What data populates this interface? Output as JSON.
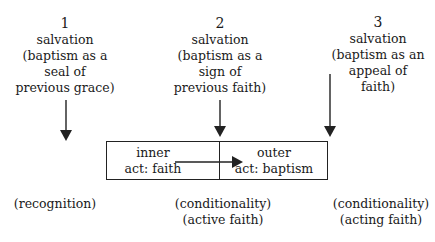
{
  "columns": [
    {
      "number": "1",
      "lines": [
        "salvation",
        "(baptism as a",
        "seal of",
        "previous grace)"
      ]
    },
    {
      "number": "2",
      "lines": [
        "salvation",
        "(baptism as a",
        "sign of",
        "previous faith)"
      ]
    },
    {
      "number": "3",
      "lines": [
        "salvation",
        "(baptism as an",
        "appeal of",
        "faith)"
      ]
    }
  ],
  "box": {
    "inner": {
      "line1": "inner",
      "line2": "act: faith"
    },
    "outer": {
      "line1": "outer",
      "line2": "act: baptism"
    }
  },
  "bottom_labels": [
    {
      "lines": [
        "(recognition)"
      ]
    },
    {
      "lines": [
        "(conditionality)",
        "(active faith)"
      ]
    },
    {
      "lines": [
        "(conditionality)",
        "(acting faith)"
      ]
    }
  ],
  "colors": {
    "stroke": "#222222",
    "text": "#1a1a1a",
    "background": "#ffffff"
  }
}
